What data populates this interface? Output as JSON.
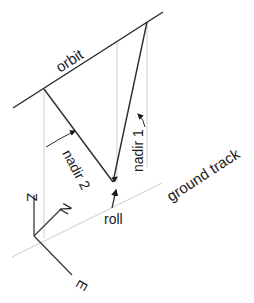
{
  "diagram": {
    "labels": {
      "orbit": "orbit",
      "ground_track": "ground track",
      "nadir_1": "nadir 1",
      "nadir_2": "nadir 2",
      "roll": "roll",
      "axis_z": "Z",
      "axis_n": "N",
      "axis_e": "E"
    },
    "colors": {
      "line_dark": "#2b2b2b",
      "line_light": "#c8c8c8",
      "text": "#1a1a1a",
      "background": "#ffffff"
    }
  }
}
